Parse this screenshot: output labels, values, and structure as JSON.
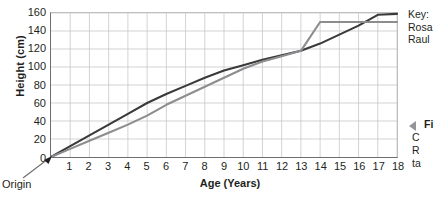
{
  "chart_data": {
    "type": "line",
    "title": "",
    "xlabel": "Age (Years)",
    "ylabel": "Height (cm)",
    "xlim": [
      0,
      18
    ],
    "ylim": [
      0,
      160
    ],
    "xticks": [
      0,
      1,
      2,
      3,
      4,
      5,
      6,
      7,
      8,
      9,
      10,
      11,
      12,
      13,
      14,
      15,
      16,
      17,
      18
    ],
    "xtick_labels": [
      "",
      "1",
      "2",
      "3",
      "4",
      "5",
      "6",
      "7",
      "8",
      "9",
      "10",
      "11",
      "12",
      "13",
      "14",
      "15",
      "16",
      "17",
      "18"
    ],
    "yticks": [
      0,
      20,
      40,
      60,
      80,
      100,
      120,
      140,
      160
    ],
    "ytick_labels": [
      "0",
      "20",
      "40",
      "60",
      "80",
      "100",
      "120",
      "140",
      "160"
    ],
    "grid": true,
    "legend_position": "right",
    "x": [
      0,
      1,
      2,
      3,
      4,
      5,
      6,
      7,
      8,
      9,
      10,
      11,
      12,
      13,
      14,
      15,
      16,
      17,
      18
    ],
    "series": [
      {
        "name": "Rosa",
        "color": "#3a3a3a",
        "values": [
          0,
          12,
          24,
          36,
          48,
          60,
          70,
          79,
          88,
          96,
          102,
          108,
          113,
          118,
          126,
          136,
          146,
          158,
          159
        ]
      },
      {
        "name": "Raul",
        "color": "#8c8d8f",
        "values": [
          0,
          9,
          18,
          27,
          36,
          46,
          58,
          68,
          78,
          88,
          98,
          106,
          112,
          118,
          150,
          150,
          150,
          150,
          150
        ]
      }
    ],
    "annotations": [
      {
        "name": "origin",
        "text": "Origin",
        "x": 0,
        "y": 0
      }
    ]
  },
  "axes": {
    "y_title": "Height (cm)",
    "x_title": "Age (Years)",
    "y_tick_labels": [
      "160",
      "140",
      "120",
      "100",
      "80",
      "60",
      "40",
      "20",
      "0"
    ],
    "x_tick_labels": [
      "1",
      "2",
      "3",
      "4",
      "5",
      "6",
      "7",
      "8",
      "9",
      "10",
      "11",
      "12",
      "13",
      "14",
      "15",
      "16",
      "17",
      "18"
    ]
  },
  "origin": {
    "label": "Origin"
  },
  "key": {
    "heading": "Key:",
    "entries": [
      "Rosa",
      "Raul"
    ]
  },
  "caption": {
    "title": "Fi",
    "lines": [
      "C",
      "R",
      "ta"
    ]
  },
  "colors": {
    "rosa": "#3a3a3a",
    "raul": "#8c8d8f",
    "grid": "#c7c8ca",
    "axis": "#6d6e71",
    "text": "#231f20"
  }
}
